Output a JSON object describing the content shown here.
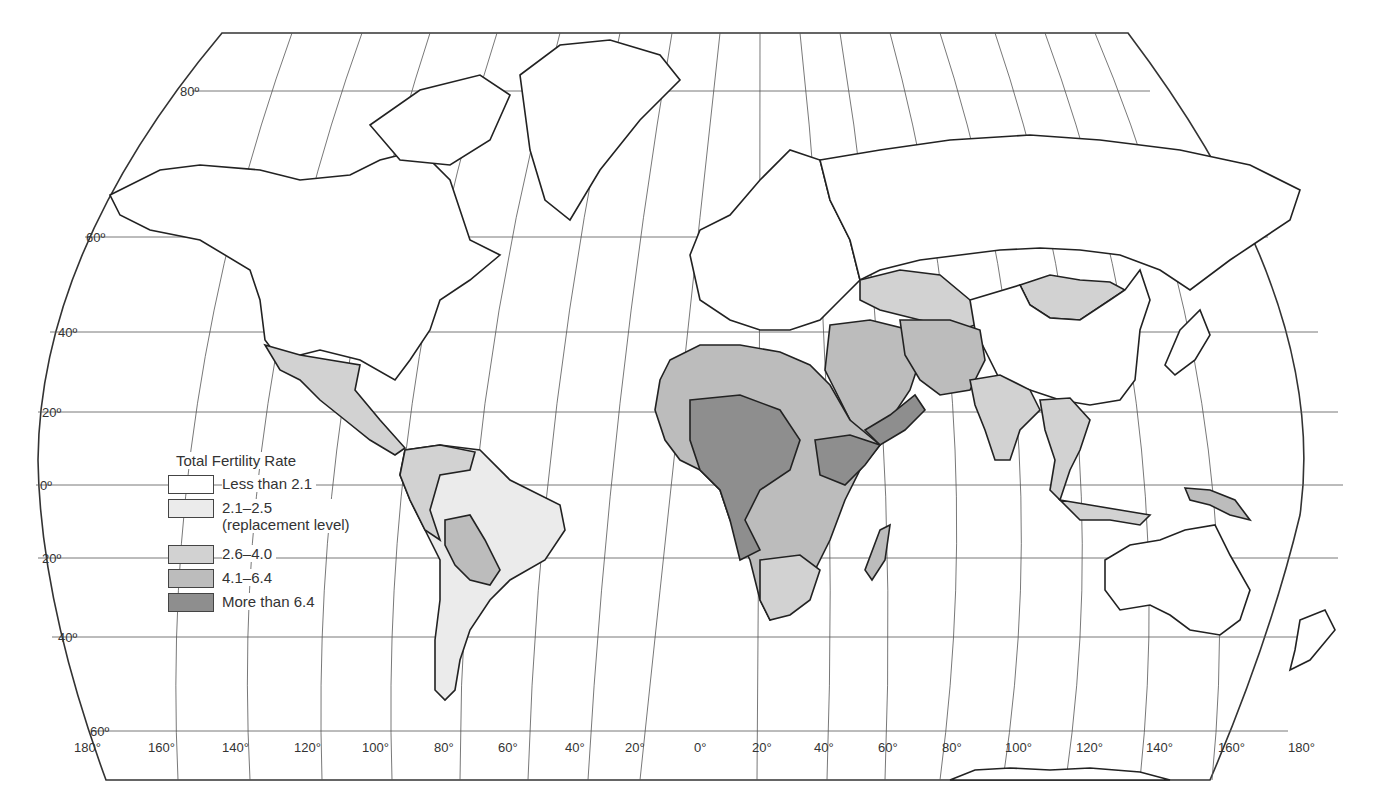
{
  "map": {
    "title": "Total Fertility Rate",
    "projection": "Robinson-like world map",
    "latitude_labels": [
      "80º",
      "60º",
      "40º",
      "20º",
      "0º",
      "20º",
      "40º",
      "60º"
    ],
    "longitude_labels": [
      "180°",
      "160°",
      "140°",
      "120°",
      "100°",
      "80°",
      "60°",
      "40°",
      "20°",
      "0°",
      "20°",
      "40°",
      "60°",
      "80°",
      "100°",
      "120°",
      "140°",
      "160°",
      "180°"
    ]
  },
  "legend": {
    "title": "Total Fertility Rate",
    "items": [
      {
        "label": "Less than 2.1",
        "sub": "",
        "color": "#ffffff"
      },
      {
        "label": "2.1–2.5",
        "sub": "(replacement level)",
        "color": "#ebebeb"
      },
      {
        "label": "2.6–4.0",
        "sub": "",
        "color": "#d2d2d2"
      },
      {
        "label": "4.1–6.4",
        "sub": "",
        "color": "#bcbcbc"
      },
      {
        "label": "More than 6.4",
        "sub": "",
        "color": "#8e8e8e"
      }
    ]
  },
  "colors": {
    "less_than_2_1": "#ffffff",
    "r2_1_2_5": "#ebebeb",
    "r2_6_4_0": "#d2d2d2",
    "r4_1_6_4": "#bcbcbc",
    "more_than_6_4": "#8e8e8e",
    "outline": "#222222"
  }
}
